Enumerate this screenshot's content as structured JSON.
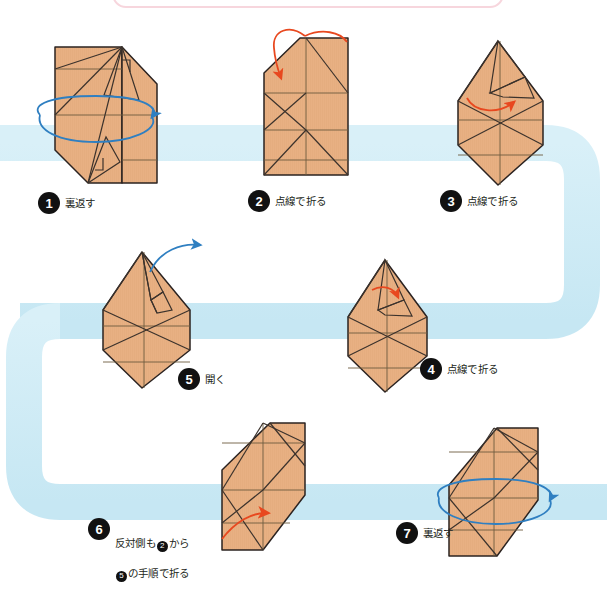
{
  "page": {
    "language": "ja",
    "background_color": "#ffffff",
    "paper_fill": "#e8b083",
    "paper_stroke": "#2b2321",
    "crease_color": "#6b5a3e",
    "ribbon_color": "#cdeaf4",
    "blue_arrow_color": "#2f7fc1",
    "red_arrow_color": "#e8481f",
    "badge_color": "#111111",
    "frame_color": "#f7d6dd"
  },
  "steps": [
    {
      "number": "1",
      "caption": "裏返す",
      "caption_lines": [
        "裏返す"
      ],
      "meaning": "turn over",
      "arrow": "blue-rotate-ellipse",
      "label_x": 38,
      "label_y": 192
    },
    {
      "number": "2",
      "caption": "点線で折る",
      "caption_lines": [
        "点線で折る"
      ],
      "meaning": "fold along the dotted line",
      "arrow": "red-fold-down",
      "label_x": 248,
      "label_y": 190
    },
    {
      "number": "3",
      "caption": "点線で折る",
      "caption_lines": [
        "点線で折る"
      ],
      "meaning": "fold along the dotted line",
      "arrow": "red-fold-up-small",
      "label_x": 440,
      "label_y": 190
    },
    {
      "number": "4",
      "caption": "点線で折る",
      "caption_lines": [
        "点線で折る"
      ],
      "meaning": "fold along the dotted line",
      "arrow": "red-fold-tiny",
      "label_x": 420,
      "label_y": 358
    },
    {
      "number": "5",
      "caption": "開く",
      "caption_lines": [
        "開く"
      ],
      "meaning": "open",
      "arrow": "blue-open",
      "label_x": 178,
      "label_y": 368
    },
    {
      "number": "6",
      "caption": "反対側も❷から❺の手順で折る",
      "caption_lines": [
        "反対側も② から",
        "⑤ の手順で折る"
      ],
      "caption_line1_pre": "反対側も",
      "caption_line1_badge": "2",
      "caption_line1_post": "から",
      "caption_line2_badge": "5",
      "caption_line2_post": "の手順で折る",
      "meaning": "fold the opposite side following steps 2 to 5",
      "arrow": "red-sweep",
      "label_x": 88,
      "label_y": 518
    },
    {
      "number": "7",
      "caption": "裏返す",
      "caption_lines": [
        "裏返す"
      ],
      "meaning": "turn over",
      "arrow": "blue-rotate-ellipse",
      "label_x": 396,
      "label_y": 522
    }
  ],
  "ribbon": {
    "description": "light blue snaking guide path connecting the steps",
    "color": "#cdeaf4",
    "thickness": 36
  }
}
